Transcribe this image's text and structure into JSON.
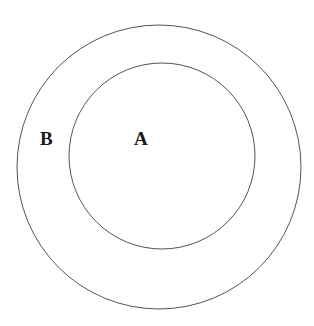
{
  "diagram": {
    "type": "nested-circles",
    "circles": [
      {
        "id": "outer",
        "label": "B",
        "cx": 159,
        "cy": 167,
        "r": 142,
        "stroke": "#555555"
      },
      {
        "id": "inner",
        "label": "A",
        "cx": 162,
        "cy": 156,
        "r": 93,
        "stroke": "#555555"
      }
    ],
    "labels": {
      "outer": "B",
      "inner": "A"
    }
  }
}
